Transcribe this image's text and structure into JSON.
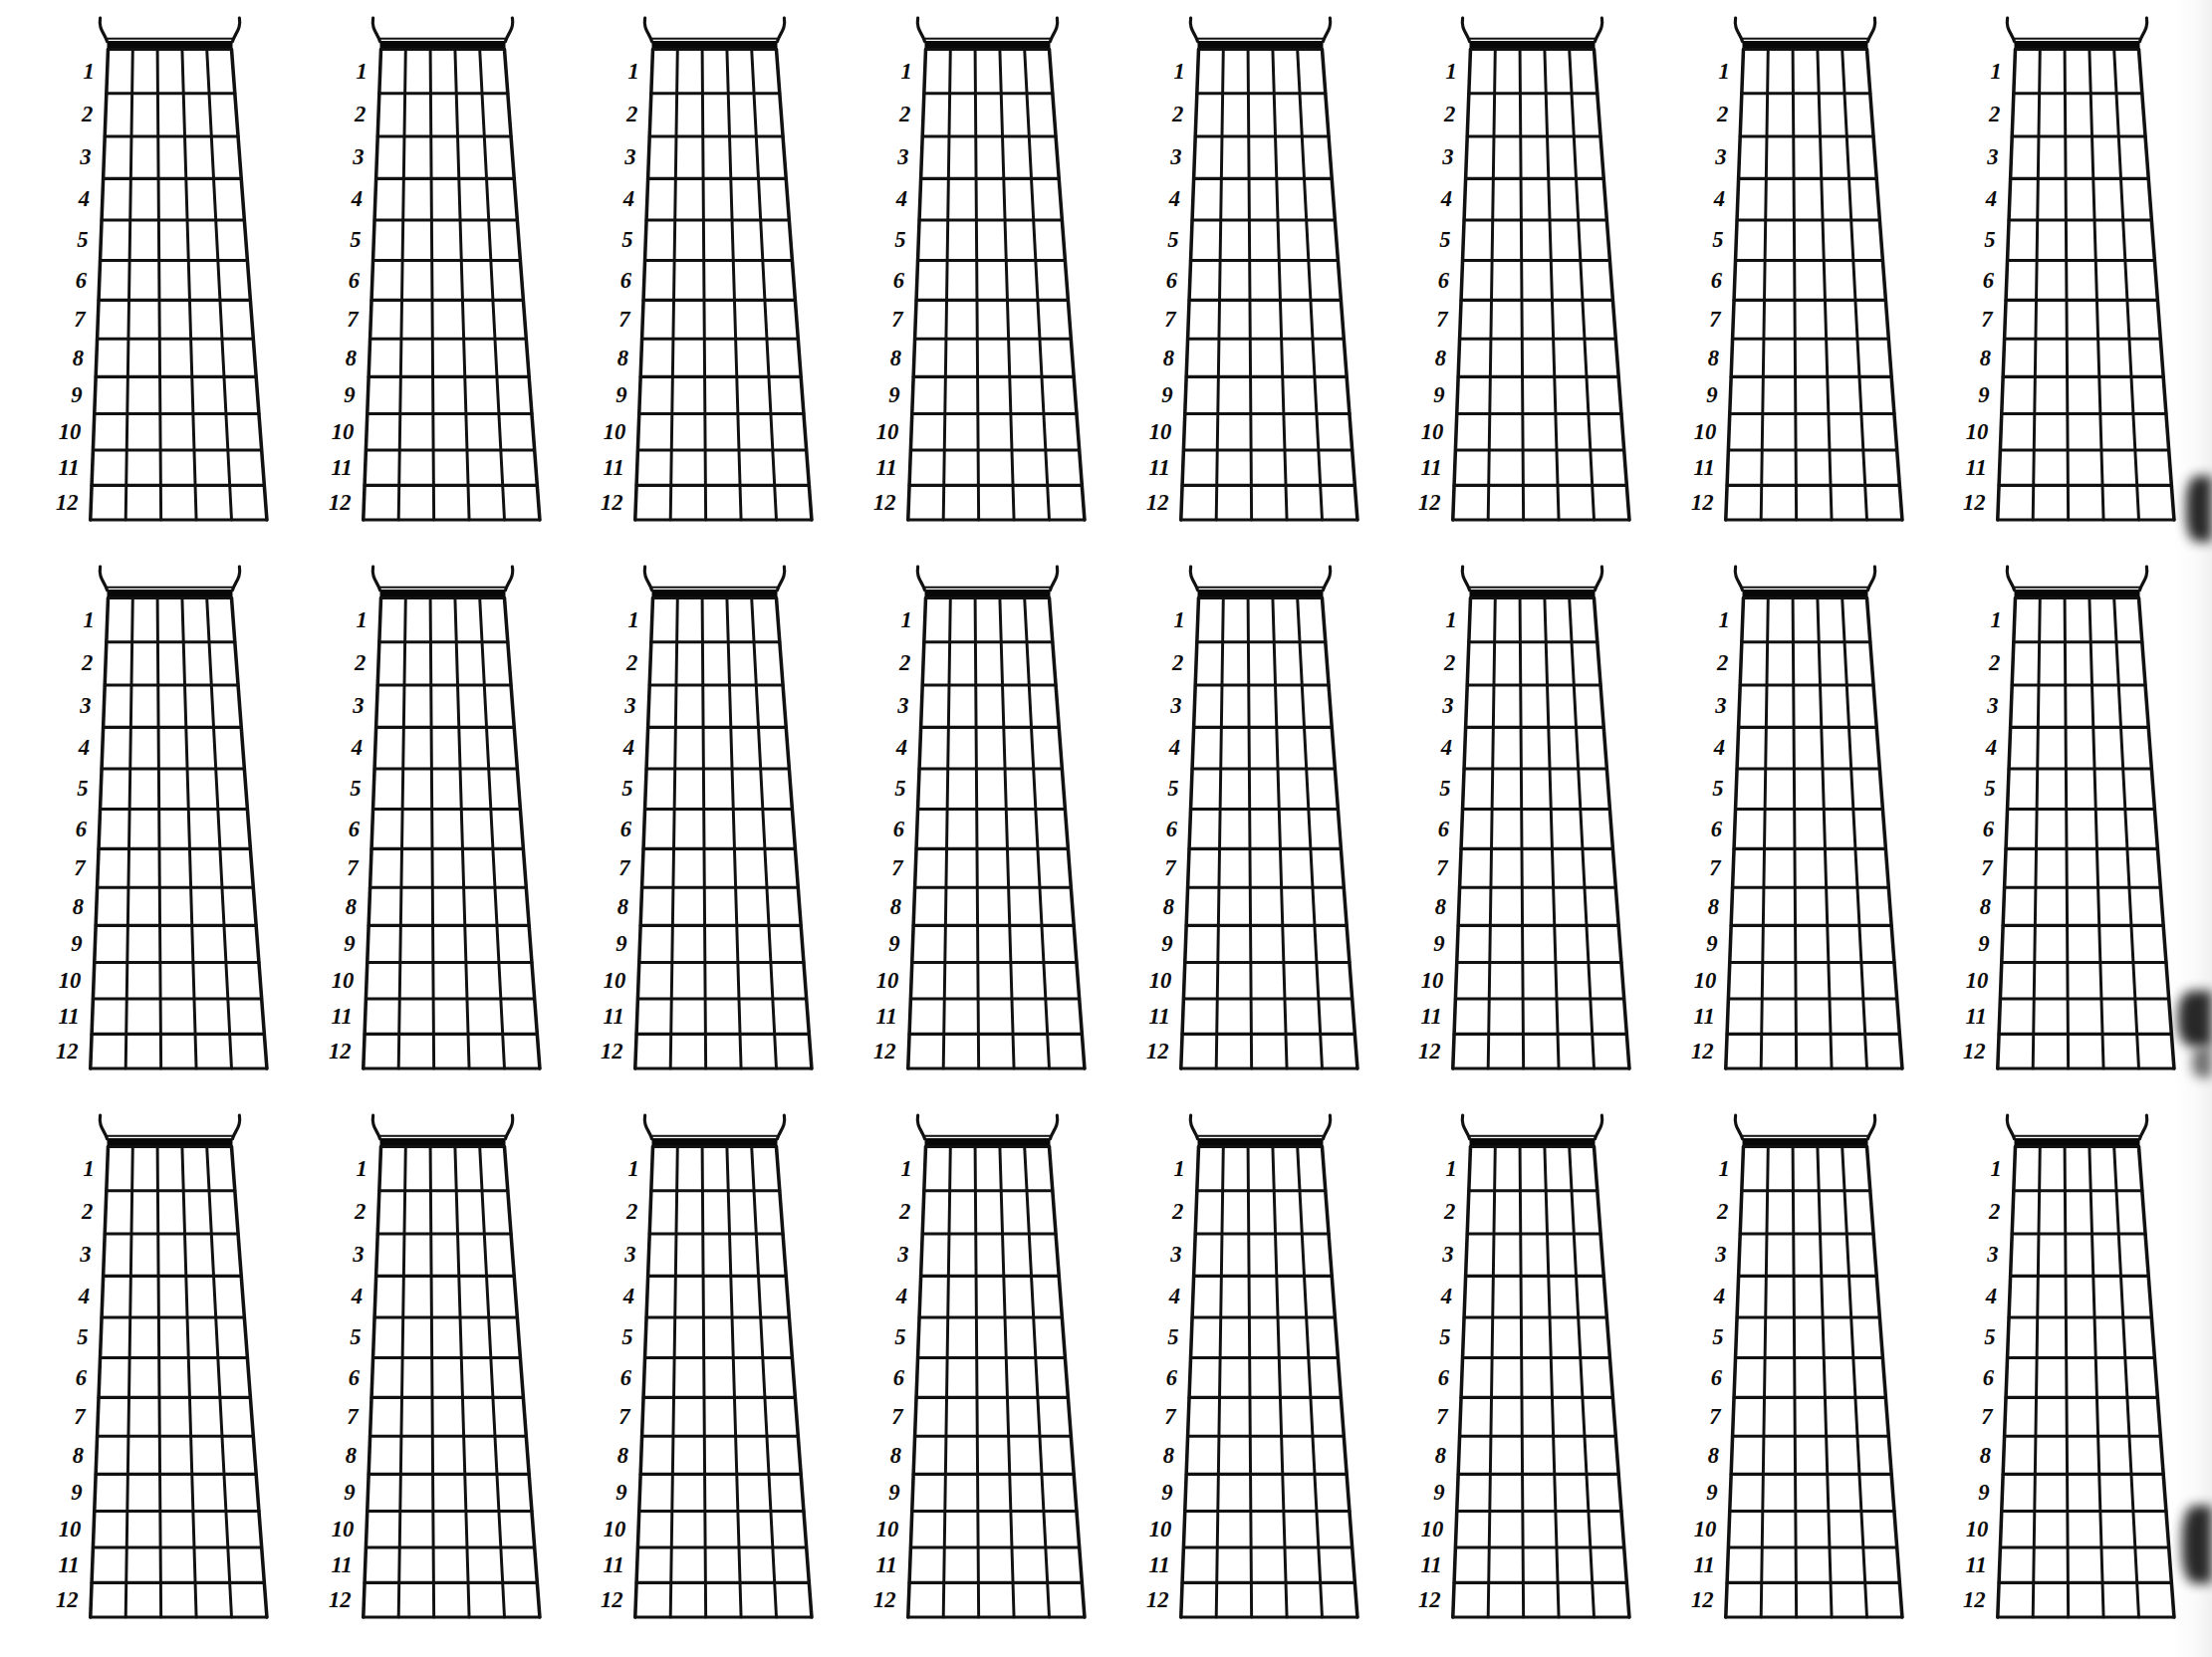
{
  "page": {
    "background_color": "#ffffff",
    "ink_color": "#111111",
    "layout": {
      "rows": 3,
      "columns": 8,
      "diagram_count": 24
    }
  },
  "diagram_template": {
    "kind": "guitar-fretboard-chart",
    "strings": 6,
    "string_gaps": 5,
    "frets": 12,
    "fret_labels": [
      "1",
      "2",
      "3",
      "4",
      "5",
      "6",
      "7",
      "8",
      "9",
      "10",
      "11",
      "12"
    ],
    "label_side": "left",
    "has_nut": true,
    "nut_style": "thick-double-bar",
    "has_corner_curls": true,
    "shape": "tapered-wider-at-bottom"
  },
  "diagrams": [
    {
      "id": 1,
      "row": 1,
      "col": 1
    },
    {
      "id": 2,
      "row": 1,
      "col": 2
    },
    {
      "id": 3,
      "row": 1,
      "col": 3
    },
    {
      "id": 4,
      "row": 1,
      "col": 4
    },
    {
      "id": 5,
      "row": 1,
      "col": 5
    },
    {
      "id": 6,
      "row": 1,
      "col": 6
    },
    {
      "id": 7,
      "row": 1,
      "col": 7
    },
    {
      "id": 8,
      "row": 1,
      "col": 8
    },
    {
      "id": 9,
      "row": 2,
      "col": 1
    },
    {
      "id": 10,
      "row": 2,
      "col": 2
    },
    {
      "id": 11,
      "row": 2,
      "col": 3
    },
    {
      "id": 12,
      "row": 2,
      "col": 4
    },
    {
      "id": 13,
      "row": 2,
      "col": 5
    },
    {
      "id": 14,
      "row": 2,
      "col": 6
    },
    {
      "id": 15,
      "row": 2,
      "col": 7
    },
    {
      "id": 16,
      "row": 2,
      "col": 8
    },
    {
      "id": 17,
      "row": 3,
      "col": 1
    },
    {
      "id": 18,
      "row": 3,
      "col": 2
    },
    {
      "id": 19,
      "row": 3,
      "col": 3
    },
    {
      "id": 20,
      "row": 3,
      "col": 4
    },
    {
      "id": 21,
      "row": 3,
      "col": 5
    },
    {
      "id": 22,
      "row": 3,
      "col": 6
    },
    {
      "id": 23,
      "row": 3,
      "col": 7
    },
    {
      "id": 24,
      "row": 3,
      "col": 8
    }
  ],
  "scan_artifacts": {
    "right_edge_shadow": true,
    "blotch_color": "#171717"
  }
}
